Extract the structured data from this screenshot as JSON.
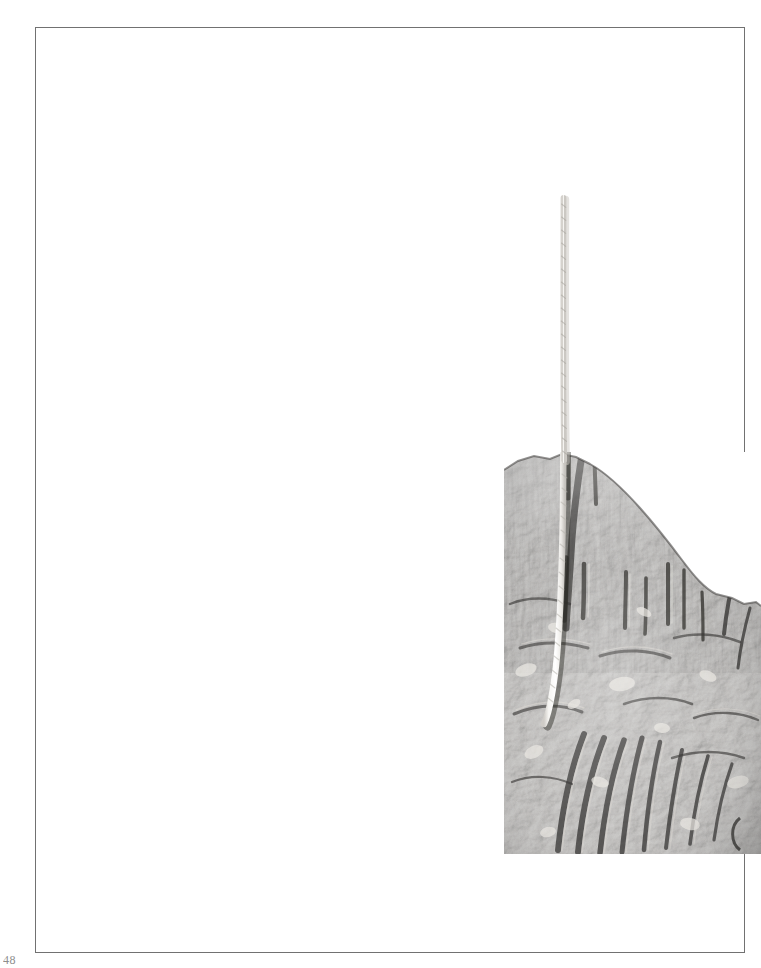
{
  "page": {
    "width_px": 761,
    "height_px": 968,
    "background_color": "#ffffff",
    "kind": "scanned-book-plate"
  },
  "frame": {
    "label": "plate-border",
    "line_color": "#6e6e6e",
    "left_px": 35,
    "top_px": 27,
    "width_px": 710,
    "height_px": 926,
    "stroke_px": 1
  },
  "folio": {
    "text": "48",
    "color": "#8d8d8d",
    "position": "bottom-left",
    "cropped": "true"
  },
  "photograph": {
    "name": "fossil-rock-specimen-photo",
    "description": "Black and white photograph of a fossiliferous limestone specimen with a white twisted string laid across it",
    "left_px": 504,
    "top_px": 452,
    "width_px": 257,
    "height_px": 402,
    "tone": "grayscale",
    "highlight_color": "#e8e6e2",
    "midtone_color": "#8d8a86",
    "shadow_color": "#2b2a29",
    "background_color": "#ffffff",
    "subject": "rock-slab-with-fossils",
    "scale_object": "white-string"
  },
  "string": {
    "name": "white-string-scale-marker",
    "color": "#f7f6f3",
    "shadow_color": "#b9b6b1",
    "top_x_px": 563,
    "top_y_px": 198,
    "bottom_x_px": 556,
    "bottom_y_px": 722,
    "width_px": 6
  },
  "content": {
    "visible_text_items": [
      "48"
    ]
  }
}
